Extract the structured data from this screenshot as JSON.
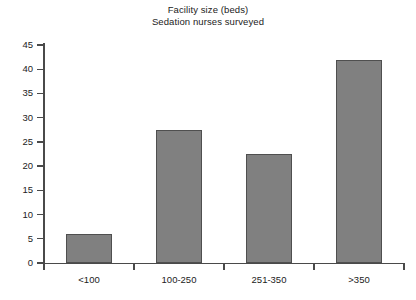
{
  "chart_data": {
    "type": "bar",
    "title": "Facility size (beds)\nSedation nurses surveyed",
    "title_lines": [
      "Facility size (beds)",
      "Sedation nurses surveyed"
    ],
    "categories": [
      "<100",
      "100-250",
      "251-350",
      ">350"
    ],
    "values": [
      6,
      27.5,
      22.5,
      42
    ],
    "xlabel": "",
    "ylabel": "",
    "ylim": [
      0,
      45
    ],
    "yticks": [
      0,
      5,
      10,
      15,
      20,
      25,
      30,
      35,
      40,
      45
    ],
    "ytick_labels": [
      "0",
      "5",
      "10",
      "15",
      "20",
      "25",
      "30",
      "35",
      "40",
      "45"
    ],
    "grid": false,
    "legend": null,
    "bar_color": "#808080",
    "bar_edge_color": "#4f4f4f",
    "axis_color": "#4a4a4a",
    "background": "#ffffff"
  }
}
